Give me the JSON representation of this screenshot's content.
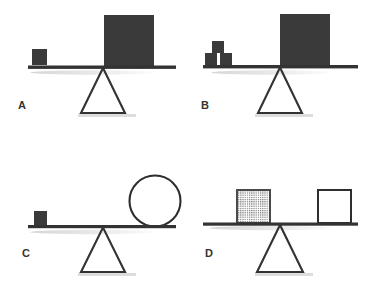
{
  "figure": {
    "background_color": "#ffffff",
    "width": 366,
    "height": 288,
    "layout": "2x2 grid of balance-beam diagrams"
  },
  "style": {
    "dark_fill": "#3a3a3a",
    "outline_color": "#2e2e2e",
    "beam_color": "#333333",
    "white_fill": "#ffffff",
    "shadow_color": "#c9c9c9",
    "label_color": "#333333",
    "hatch_color": "#707070"
  },
  "panels": [
    {
      "id": "a",
      "label": "A",
      "beam_state": "level",
      "fulcrum": "triangle-outline",
      "left_object": {
        "name": "small-dark-square",
        "shape": "square",
        "fill": "solid-dark",
        "size": "small"
      },
      "right_object": {
        "name": "large-dark-square",
        "shape": "square",
        "fill": "solid-dark",
        "size": "large"
      }
    },
    {
      "id": "b",
      "label": "B",
      "beam_state": "level",
      "fulcrum": "triangle-outline",
      "left_object": {
        "name": "small-dark-square-cluster",
        "shape": "stacked-squares",
        "fill": "solid-dark",
        "size": "small",
        "count": 3
      },
      "right_object": {
        "name": "large-dark-square",
        "shape": "square",
        "fill": "solid-dark",
        "size": "large"
      }
    },
    {
      "id": "c",
      "label": "C",
      "beam_state": "level",
      "fulcrum": "triangle-outline",
      "left_object": {
        "name": "small-dark-square",
        "shape": "square",
        "fill": "solid-dark",
        "size": "small"
      },
      "right_object": {
        "name": "large-open-circle",
        "shape": "circle",
        "fill": "outline-white",
        "size": "large"
      }
    },
    {
      "id": "d",
      "label": "D",
      "beam_state": "level",
      "fulcrum": "triangle-outline",
      "left_object": {
        "name": "hatched-square",
        "shape": "square",
        "fill": "grid-hatch",
        "size": "medium"
      },
      "right_object": {
        "name": "open-white-square",
        "shape": "square",
        "fill": "outline-white",
        "size": "medium"
      }
    }
  ]
}
